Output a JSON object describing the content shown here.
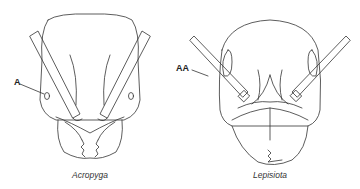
{
  "figure": {
    "left_specimen": {
      "caption": "Acropyga",
      "callout_label": "A",
      "feature": "eye"
    },
    "right_specimen": {
      "caption": "Lepisiota",
      "callout_label": "AA",
      "feature": "antenna"
    },
    "colors": {
      "line": "#333333",
      "background": "#ffffff"
    }
  }
}
